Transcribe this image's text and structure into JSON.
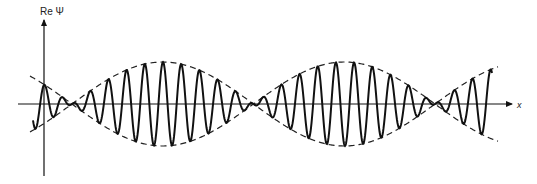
{
  "figure": {
    "y_axis_label": "Re Ψ",
    "x_axis_label": "x"
  },
  "chart_data": {
    "type": "line",
    "title": "",
    "xlabel": "x",
    "ylabel": "Re Ψ",
    "grid": false,
    "legend": null,
    "envelope": {
      "style": "dashed",
      "node_positions_px": [
        72,
        253,
        435
      ],
      "max_amplitude_px": 42,
      "beat_period_px": 363
    },
    "carrier": {
      "wavelength_px": 18.2
    },
    "layout": {
      "origin_px": [
        44,
        104
      ],
      "x_axis_end_px": 512,
      "y_axis_top_px": 20,
      "y_axis_bottom_px": 176,
      "curve_start_px": 33,
      "curve_end_px": 492
    }
  }
}
